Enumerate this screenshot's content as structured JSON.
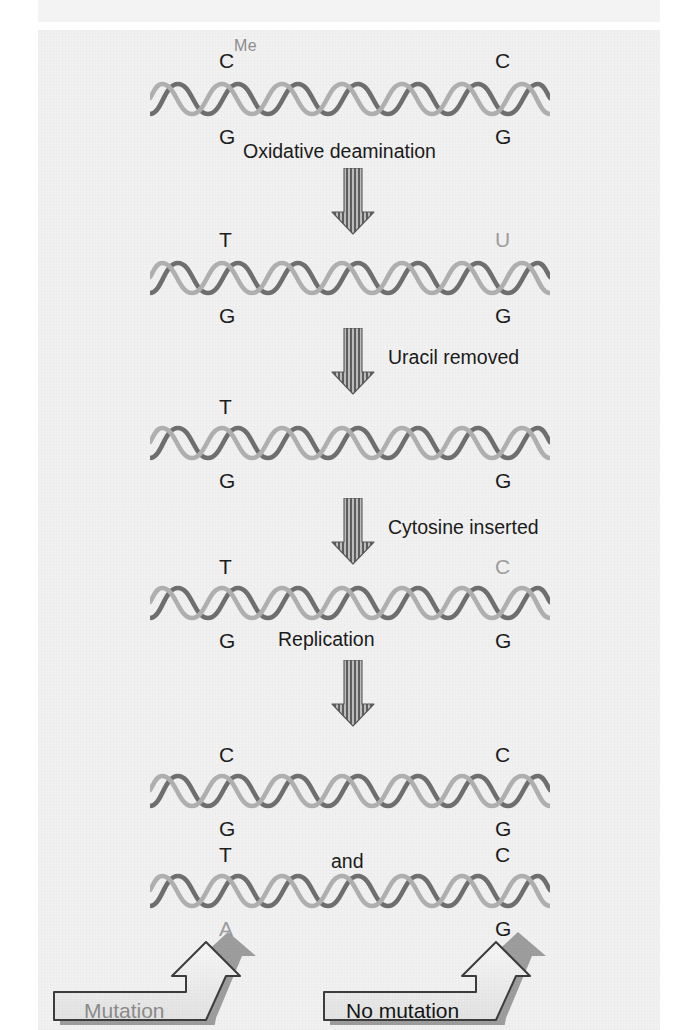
{
  "figure": {
    "clipped_header_text": "",
    "background_color": "#f1f1f1",
    "panel_color": "#f3f3f3"
  },
  "colors": {
    "strand_dark": "#6f6f6f",
    "strand_light": "#b3b3b3",
    "text_dark": "#1d1d1d",
    "text_light": "#9d9d9d",
    "arrow_fill": "#9a9a9a",
    "arrow_stroke": "#4a4a4a",
    "banner_fill": "#ececec",
    "banner_stroke": "#3d3d3d",
    "banner_shadow": "#7d7d7d"
  },
  "steps": [
    {
      "id": "step-1-methylated-cytosine",
      "left_top": "C",
      "left_top_sup": "Me",
      "left_top_style": "dark",
      "left_bottom": "G",
      "left_bottom_style": "dark",
      "right_top": "C",
      "right_top_style": "dark",
      "right_bottom": "G",
      "right_bottom_style": "dark"
    },
    {
      "id": "step-2-after-deamination",
      "left_top": "T",
      "left_top_sup": "",
      "left_top_style": "dark",
      "left_bottom": "G",
      "left_bottom_style": "dark",
      "right_top": "U",
      "right_top_style": "light",
      "right_bottom": "G",
      "right_bottom_style": "dark"
    },
    {
      "id": "step-3-uracil-excised",
      "left_top": "T",
      "left_top_sup": "",
      "left_top_style": "dark",
      "left_bottom": "G",
      "left_bottom_style": "dark",
      "right_top": "",
      "right_top_style": "dark",
      "right_bottom": "G",
      "right_bottom_style": "dark"
    },
    {
      "id": "step-4-cytosine-restored",
      "left_top": "T",
      "left_top_sup": "",
      "left_top_style": "dark",
      "left_bottom": "G",
      "left_bottom_style": "dark",
      "right_top": "C",
      "right_top_style": "light",
      "right_bottom": "G",
      "right_bottom_style": "dark"
    },
    {
      "id": "step-5-daughter-duplex-a",
      "left_top": "C",
      "left_top_sup": "",
      "left_top_style": "dark",
      "left_bottom": "G",
      "left_bottom_style": "dark",
      "right_top": "C",
      "right_top_style": "dark",
      "right_bottom": "G",
      "right_bottom_style": "dark"
    },
    {
      "id": "step-6-daughter-duplex-b",
      "left_top": "T",
      "left_top_sup": "",
      "left_top_style": "dark",
      "left_bottom": "A",
      "left_bottom_style": "light",
      "right_top": "C",
      "right_top_style": "dark",
      "right_bottom": "G",
      "right_bottom_style": "dark"
    }
  ],
  "process_labels": [
    {
      "id": "oxidative-deamination",
      "text": "Oxidative deamination"
    },
    {
      "id": "uracil-removed",
      "text": "Uracil removed"
    },
    {
      "id": "cytosine-inserted",
      "text": "Cytosine inserted"
    },
    {
      "id": "replication",
      "text": "Replication"
    }
  ],
  "conjunction": {
    "text": "and"
  },
  "outcomes": [
    {
      "id": "mutation",
      "text": "Mutation"
    },
    {
      "id": "no-mutation",
      "text": "No mutation"
    }
  ]
}
